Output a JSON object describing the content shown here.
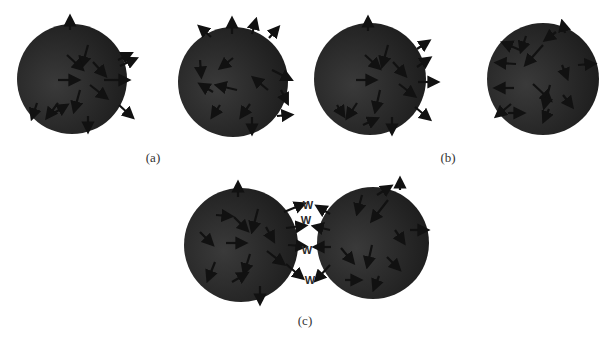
{
  "figure": {
    "colors": {
      "background": "#ffffff",
      "sphere_dark": "#1c1c1c",
      "sphere_light": "#3a3a3a",
      "arrow": "#111111",
      "label": "#333333"
    },
    "panels": [
      {
        "id": "a",
        "label": "(a)",
        "label_pos": [
          153,
          158
        ],
        "spheres": [
          {
            "cx": 72,
            "cy": 79,
            "r": 55,
            "arrows": [
              [
                70,
                30,
                70,
                20
              ],
              [
                88,
                45,
                83,
                63
              ],
              [
                67,
                55,
                80,
                67
              ],
              [
                93,
                62,
                103,
                73
              ],
              [
                58,
                80,
                75,
                80
              ],
              [
                90,
                85,
                104,
                96
              ],
              [
                80,
                90,
                75,
                108
              ],
              [
                58,
                103,
                49,
                115
              ],
              [
                104,
                80,
                125,
                80
              ],
              [
                88,
                116,
                88,
                128
              ],
              [
                120,
                66,
                133,
                60
              ],
              [
                118,
                60,
                128,
                55
              ],
              [
                119,
                105,
                130,
                115
              ],
              [
                37,
                103,
                33,
                115
              ],
              [
                54,
                113,
                64,
                107
              ]
            ]
          },
          {
            "cx": 233,
            "cy": 82,
            "r": 55,
            "arrows": [
              [
                211,
                37,
                202,
                29
              ],
              [
                232,
                34,
                232,
                22
              ],
              [
                252,
                34,
                255,
                23
              ],
              [
                269,
                38,
                276,
                30
              ],
              [
                200,
                60,
                201,
                73
              ],
              [
                233,
                58,
                223,
                66
              ],
              [
                272,
                70,
                288,
                78
              ],
              [
                268,
                90,
                256,
                80
              ],
              [
                281,
                90,
                286,
                100
              ],
              [
                237,
                90,
                220,
                86
              ],
              [
                213,
                92,
                203,
                86
              ],
              [
                220,
                105,
                214,
                114
              ],
              [
                250,
                104,
                243,
                114
              ],
              [
                252,
                117,
                252,
                130
              ],
              [
                277,
                116,
                288,
                115
              ]
            ]
          }
        ]
      },
      {
        "id": "b",
        "label": "(b)",
        "label_pos": [
          448,
          158
        ],
        "spheres": [
          {
            "cx": 370,
            "cy": 79,
            "r": 56,
            "arrows": [
              [
                368,
                31,
                368,
                21
              ],
              [
                388,
                45,
                383,
                63
              ],
              [
                365,
                55,
                377,
                66
              ],
              [
                393,
                62,
                403,
                73
              ],
              [
                356,
                80,
                372,
                80
              ],
              [
                399,
                84,
                412,
                94
              ],
              [
                380,
                90,
                376,
                108
              ],
              [
                357,
                103,
                349,
                115
              ],
              [
                418,
                82,
                434,
                82
              ],
              [
                392,
                117,
                392,
                130
              ],
              [
                417,
                67,
                427,
                60
              ],
              [
                417,
                49,
                426,
                43
              ],
              [
                415,
                107,
                427,
                117
              ],
              [
                337,
                105,
                342,
                113
              ],
              [
                363,
                125,
                374,
                120
              ]
            ]
          },
          {
            "cx": 543,
            "cy": 79,
            "r": 56,
            "arrows": [
              [
                520,
                50,
                506,
                44
              ],
              [
                516,
                64,
                500,
                63
              ],
              [
                514,
                88,
                499,
                88
              ],
              [
                511,
                104,
                499,
                114
              ],
              [
                526,
                36,
                522,
                48
              ],
              [
                543,
                45,
                528,
                62
              ],
              [
                556,
                32,
                548,
                38
              ],
              [
                565,
                33,
                563,
                25
              ],
              [
                562,
                65,
                566,
                75
              ],
              [
                578,
                65,
                591,
                64
              ],
              [
                533,
                84,
                548,
                98
              ],
              [
                550,
                85,
                545,
                104
              ],
              [
                563,
                95,
                570,
                104
              ],
              [
                549,
                109,
                545,
                118
              ],
              [
                508,
                113,
                520,
                113
              ]
            ]
          }
        ]
      },
      {
        "id": "c",
        "label": "(c)",
        "label_pos": [
          305,
          321
        ],
        "spheres": [
          {
            "cx": 241,
            "cy": 245,
            "r": 57,
            "arrows": [
              [
                238,
                197,
                238,
                186
              ],
              [
                258,
                209,
                253,
                228
              ],
              [
                234,
                217,
                245,
                228
              ],
              [
                266,
                227,
                272,
                238
              ],
              [
                226,
                243,
                242,
                243
              ],
              [
                267,
                251,
                281,
                262
              ],
              [
                250,
                254,
                245,
                270
              ],
              [
                215,
                262,
                209,
                277
              ],
              [
                232,
                282,
                244,
                275
              ],
              [
                260,
                286,
                260,
                300
              ],
              [
                216,
                215,
                228,
                216
              ],
              [
                200,
                232,
                210,
                242
              ]
            ]
          },
          {
            "cx": 373,
            "cy": 243,
            "r": 56,
            "arrows": [
              [
                362,
                195,
                358,
                210
              ],
              [
                377,
                195,
                388,
                188
              ],
              [
                400,
                190,
                400,
                182
              ],
              [
                388,
                200,
                374,
                218
              ],
              [
                395,
                230,
                402,
                240
              ],
              [
                410,
                230,
                424,
                230
              ],
              [
                341,
                248,
                351,
                260
              ],
              [
                372,
                245,
                368,
                263
              ],
              [
                387,
                257,
                397,
                267
              ],
              [
                379,
                276,
                375,
                286
              ],
              [
                345,
                280,
                357,
                280
              ]
            ]
          }
        ],
        "exchange_arrows": [
          [
            284,
            212,
            301,
            205
          ],
          [
            286,
            228,
            302,
            226
          ],
          [
            288,
            245,
            302,
            246
          ],
          [
            286,
            264,
            300,
            276
          ],
          [
            330,
            214,
            320,
            208
          ],
          [
            330,
            230,
            317,
            227
          ],
          [
            331,
            247,
            318,
            247
          ],
          [
            330,
            265,
            318,
            278
          ]
        ],
        "w_labels": [
          {
            "text": "W",
            "x": 308,
            "y": 209
          },
          {
            "text": "W",
            "x": 306,
            "y": 224
          },
          {
            "text": "W",
            "x": 307,
            "y": 254
          },
          {
            "text": "W",
            "x": 310,
            "y": 284
          }
        ]
      }
    ]
  }
}
